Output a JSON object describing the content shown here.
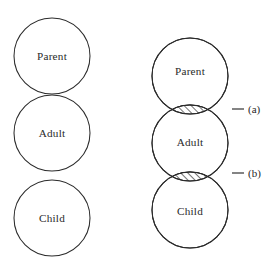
{
  "figure": {
    "background_color": "#ffffff",
    "stroke_color": "#2b2b2b",
    "hatch_color": "#1f1f1f",
    "panels": [
      {
        "id": "left-panel",
        "name": "tangent-circles-diagram",
        "description": "Three vertically stacked tangent circles",
        "circles": [
          {
            "id": "left-parent",
            "label": "Parent",
            "cx": 52,
            "cy": 56,
            "r": 38
          },
          {
            "id": "left-adult",
            "label": "Adult",
            "cx": 52,
            "cy": 133,
            "r": 38
          },
          {
            "id": "left-child",
            "label": "Child",
            "cx": 52,
            "cy": 218,
            "r": 38
          }
        ]
      },
      {
        "id": "right-panel",
        "name": "overlapping-circles-diagram",
        "description": "Three vertically stacked overlapping circles with hatched intersection lenses",
        "circles": [
          {
            "id": "right-parent",
            "label": "Parent",
            "cx": 190,
            "cy": 76,
            "r": 38
          },
          {
            "id": "right-adult",
            "label": "Adult",
            "cx": 190,
            "cy": 143,
            "r": 38
          },
          {
            "id": "right-child",
            "label": "Child",
            "cx": 190,
            "cy": 210,
            "r": 38
          }
        ],
        "lenses": [
          {
            "id": "lens-a",
            "between": "Parent-Adult",
            "cy": 109.5,
            "callout": "(a)"
          },
          {
            "id": "lens-b",
            "between": "Adult-Child",
            "cy": 176.5,
            "callout": "(b)"
          }
        ]
      }
    ],
    "callouts": [
      {
        "id": "callout-a",
        "text": "(a)",
        "dash_x1": 232,
        "dash_x2": 244,
        "text_x": 248,
        "y": 109
      },
      {
        "id": "callout-b",
        "text": "(b)",
        "dash_x1": 232,
        "dash_x2": 244,
        "text_x": 248,
        "y": 173
      }
    ]
  },
  "labels": {
    "left": {
      "parent": "Parent",
      "adult": "Adult",
      "child": "Child"
    },
    "right": {
      "parent": "Parent",
      "adult": "Adult",
      "child": "Child"
    },
    "callout_a": "(a)",
    "callout_b": "(b)"
  }
}
